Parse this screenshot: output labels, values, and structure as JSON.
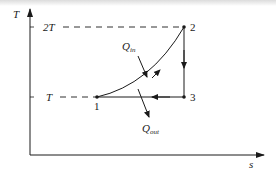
{
  "diagram": {
    "type": "T-s diagram",
    "axes": {
      "y_label": "T",
      "x_label": "s",
      "y_ticks": [
        {
          "label": "2T",
          "level": "2T"
        },
        {
          "label": "T",
          "level": "T"
        }
      ]
    },
    "states": [
      {
        "id": "1",
        "label": "1",
        "temperature": "T"
      },
      {
        "id": "2",
        "label": "2",
        "temperature": "2T"
      },
      {
        "id": "3",
        "label": "3",
        "temperature": "T"
      }
    ],
    "processes": [
      {
        "from": "1",
        "to": "2",
        "shape": "curve"
      },
      {
        "from": "2",
        "to": "3",
        "shape": "vertical line"
      },
      {
        "from": "3",
        "to": "1",
        "shape": "horizontal line"
      }
    ],
    "heat_labels": {
      "q_in_main": "Q",
      "q_in_sub": "in",
      "q_out_main": "Q",
      "q_out_sub": "out"
    },
    "colors": {
      "ink": "#1a1a1a",
      "background": "#ffffff"
    }
  }
}
